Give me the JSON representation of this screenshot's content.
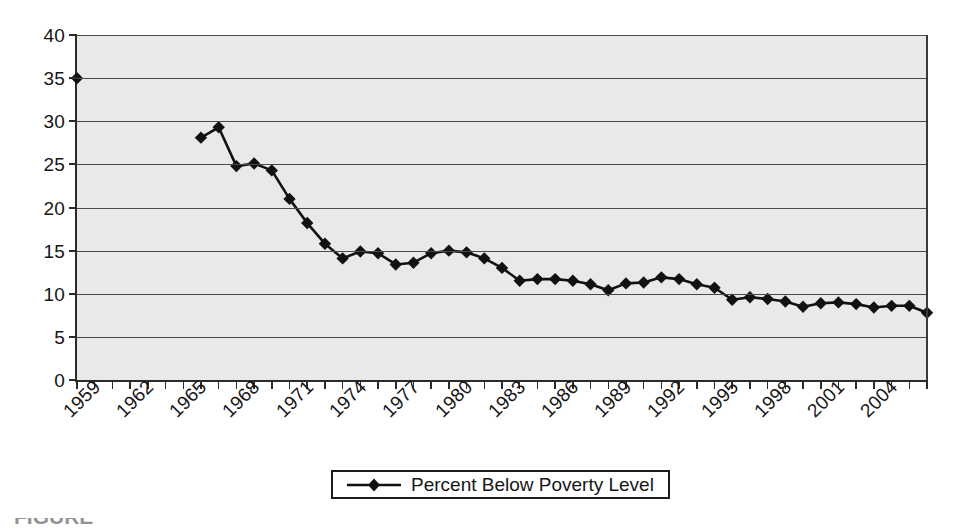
{
  "chart_data": {
    "type": "line",
    "title": "",
    "subtitle": "",
    "xlabel": "",
    "ylabel": "",
    "ylim": [
      0,
      40
    ],
    "ytick_step": 5,
    "yticks": [
      "0",
      "5",
      "10",
      "15",
      "20",
      "25",
      "30",
      "35",
      "40"
    ],
    "grid": true,
    "legend_position": "bottom-center",
    "marker": "diamond",
    "line_color": "#111111",
    "marker_color": "#111111",
    "plot_background": "#e9e9e9",
    "gridline_color": "#4a4a4a",
    "axis_color": "#2b2b2b",
    "x_tick_labels": [
      "1959",
      "1962",
      "1965",
      "1968",
      "1971",
      "1974",
      "1977",
      "1980",
      "1983",
      "1986",
      "1989",
      "1992",
      "1995",
      "1998",
      "2001",
      "2004"
    ],
    "x_tick_label_interval": 3,
    "x_first_category": 1959,
    "x_last_category": 2007,
    "series": [
      {
        "name": "Percent Below Poverty Level",
        "x": [
          1959,
          1966,
          1967,
          1968,
          1969,
          1970,
          1971,
          1972,
          1973,
          1974,
          1975,
          1976,
          1977,
          1978,
          1979,
          1980,
          1981,
          1982,
          1983,
          1984,
          1985,
          1986,
          1987,
          1988,
          1989,
          1990,
          1991,
          1992,
          1993,
          1994,
          1995,
          1996,
          1997,
          1998,
          1999,
          2000,
          2001,
          2002,
          2003,
          2004,
          2005,
          2006,
          2007
        ],
        "values": [
          35.0,
          28.1,
          29.3,
          24.8,
          25.1,
          24.3,
          21.0,
          18.2,
          15.8,
          14.1,
          14.9,
          14.7,
          13.4,
          13.6,
          14.7,
          15.0,
          14.8,
          14.1,
          13.0,
          11.5,
          11.7,
          11.7,
          11.5,
          11.1,
          10.4,
          11.2,
          11.3,
          11.9,
          11.7,
          11.1,
          10.7,
          9.3,
          9.6,
          9.4,
          9.1,
          8.5,
          8.9,
          9.0,
          8.8,
          8.4,
          8.6,
          8.6,
          7.8
        ]
      }
    ],
    "note": "Data gap between 1959 and 1966; no markers plotted for 1960-1965"
  },
  "legend": {
    "entries": [
      {
        "label": "Percent Below Poverty Level",
        "marker": "diamond",
        "color": "#111111"
      }
    ]
  },
  "caption": {
    "text": "FIGURE"
  }
}
